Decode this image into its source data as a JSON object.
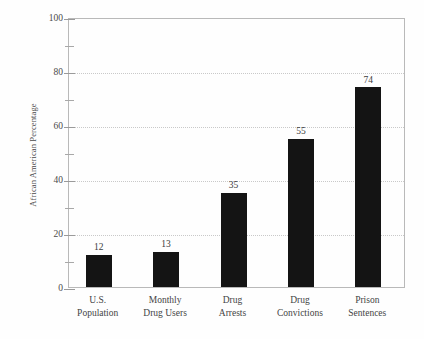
{
  "chart_data": {
    "type": "bar",
    "title": "",
    "subtitle": "",
    "xlabel": "",
    "ylabel": "African American Percentage",
    "ylim": [
      0,
      100
    ],
    "y_major_ticks": [
      0,
      20,
      40,
      60,
      80,
      100
    ],
    "y_minor_ticks": [
      10,
      30,
      50,
      70,
      90
    ],
    "y_tick_labels": [
      "0",
      "20",
      "40",
      "60",
      "80",
      "100"
    ],
    "gridlines": [
      20,
      40,
      60,
      80
    ],
    "grid": true,
    "legend": null,
    "bar_color": "#141414",
    "grid_color": "#c9c9c9",
    "axis_color": "#b9b9b9",
    "categories": [
      "U.S. Population",
      "Monthly Drug Users",
      "Drug Arrests",
      "Drug Convictions",
      "Prison Sentences"
    ],
    "category_lines": [
      [
        "U.S.",
        "Population"
      ],
      [
        "Monthly",
        "Drug Users"
      ],
      [
        "Drug",
        "Arrests"
      ],
      [
        "Drug",
        "Convictions"
      ],
      [
        "Prison",
        "Sentences"
      ]
    ],
    "values": [
      12,
      13,
      35,
      55,
      74
    ],
    "value_labels": [
      "12",
      "13",
      "35",
      "55",
      "74"
    ]
  }
}
